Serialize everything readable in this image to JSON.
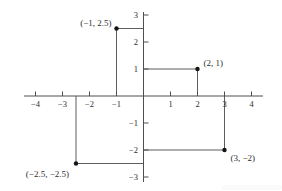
{
  "figure": {
    "background": "#ffffff"
  },
  "chart_data": {
    "type": "scatter",
    "title": "",
    "xlabel": "",
    "ylabel": "",
    "xlim": [
      -4.4,
      4.4
    ],
    "ylim": [
      -3.2,
      3.1
    ],
    "grid": false,
    "legend": false,
    "x_ticks": [
      {
        "v": -4,
        "label": "−4"
      },
      {
        "v": -3,
        "label": "−3"
      },
      {
        "v": -2,
        "label": "−2"
      },
      {
        "v": -1,
        "label": "−1"
      },
      {
        "v": 1,
        "label": "1"
      },
      {
        "v": 2,
        "label": "2"
      },
      {
        "v": 3,
        "label": "3"
      },
      {
        "v": 4,
        "label": "4"
      }
    ],
    "y_ticks": [
      {
        "v": 3,
        "label": "3"
      },
      {
        "v": 2,
        "label": "2"
      },
      {
        "v": 1,
        "label": "1"
      },
      {
        "v": -1,
        "label": "−1"
      },
      {
        "v": -2,
        "label": "−2"
      },
      {
        "v": -3,
        "label": "−3"
      }
    ],
    "points": [
      {
        "x": -1,
        "y": 2.5,
        "label": "(−1, 2.5)",
        "label_side": "left"
      },
      {
        "x": 2,
        "y": 1,
        "label": "(2, 1)",
        "label_side": "right"
      },
      {
        "x": -2.5,
        "y": -2.5,
        "label": "(−2.5, −2.5)",
        "label_side": "below-left"
      },
      {
        "x": 3,
        "y": -2,
        "label": "(3, −2)",
        "label_side": "below-right"
      }
    ],
    "guides": "each point is connected to the y-axis by a horizontal segment and to the x-axis by a vertical segment",
    "colors": {
      "axis": "#4f4f4f",
      "guide": "#5d5d5d",
      "point": "#141414",
      "text": "#2e2e2e",
      "artifact": "#fafafa"
    }
  }
}
